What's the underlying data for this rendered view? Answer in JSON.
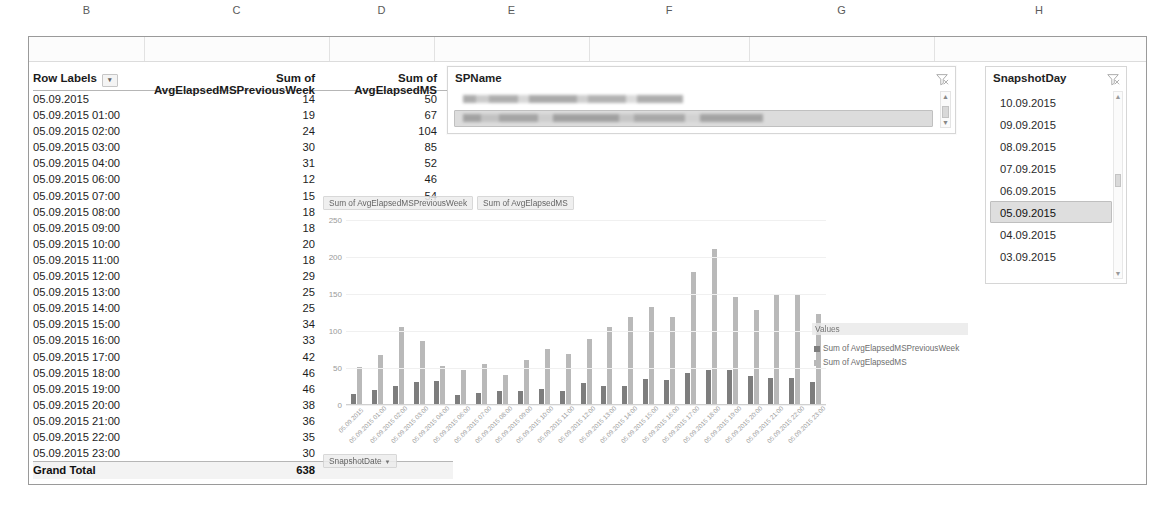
{
  "spreadsheet": {
    "columns": [
      "B",
      "C",
      "D",
      "E",
      "F",
      "G",
      "H"
    ]
  },
  "pivot_table": {
    "headers": {
      "row_labels": "Row Labels",
      "filter_icon": "filter-dropdown-icon",
      "col_prev": "Sum of AvgElapsedMSPreviousWeek",
      "col_curr": "Sum of AvgElapsedMS"
    },
    "rows": [
      {
        "label": "05.09.2015",
        "prev": "14",
        "curr": "50"
      },
      {
        "label": "05.09.2015 01:00",
        "prev": "19",
        "curr": "67"
      },
      {
        "label": "05.09.2015 02:00",
        "prev": "24",
        "curr": "104"
      },
      {
        "label": "05.09.2015 03:00",
        "prev": "30",
        "curr": "85"
      },
      {
        "label": "05.09.2015 04:00",
        "prev": "31",
        "curr": "52"
      },
      {
        "label": "05.09.2015 06:00",
        "prev": "12",
        "curr": "46"
      },
      {
        "label": "05.09.2015 07:00",
        "prev": "15",
        "curr": "54"
      },
      {
        "label": "05.09.2015 08:00",
        "prev": "18",
        "curr": ""
      },
      {
        "label": "05.09.2015 09:00",
        "prev": "18",
        "curr": ""
      },
      {
        "label": "05.09.2015 10:00",
        "prev": "20",
        "curr": ""
      },
      {
        "label": "05.09.2015 11:00",
        "prev": "18",
        "curr": ""
      },
      {
        "label": "05.09.2015 12:00",
        "prev": "29",
        "curr": ""
      },
      {
        "label": "05.09.2015 13:00",
        "prev": "25",
        "curr": ""
      },
      {
        "label": "05.09.2015 14:00",
        "prev": "25",
        "curr": ""
      },
      {
        "label": "05.09.2015 15:00",
        "prev": "34",
        "curr": ""
      },
      {
        "label": "05.09.2015 16:00",
        "prev": "33",
        "curr": ""
      },
      {
        "label": "05.09.2015 17:00",
        "prev": "42",
        "curr": ""
      },
      {
        "label": "05.09.2015 18:00",
        "prev": "46",
        "curr": ""
      },
      {
        "label": "05.09.2015 19:00",
        "prev": "46",
        "curr": ""
      },
      {
        "label": "05.09.2015 20:00",
        "prev": "38",
        "curr": ""
      },
      {
        "label": "05.09.2015 21:00",
        "prev": "36",
        "curr": ""
      },
      {
        "label": "05.09.2015 22:00",
        "prev": "35",
        "curr": ""
      },
      {
        "label": "05.09.2015 23:00",
        "prev": "30",
        "curr": ""
      }
    ],
    "grand_total": {
      "label": "Grand Total",
      "prev": "638",
      "curr": ""
    }
  },
  "slicer_spname": {
    "title": "SPName",
    "clear_filter_icon": "clear-filter-icon",
    "items": [
      {
        "redacted": true,
        "selected": false,
        "width": 220
      },
      {
        "redacted": true,
        "selected": true,
        "width": 300
      }
    ],
    "scroll_up_icon": "scroll-up-arrow-icon",
    "scroll_down_icon": "scroll-down-arrow-icon"
  },
  "slicer_snapshotday": {
    "title": "SnapshotDay",
    "clear_filter_icon": "clear-filter-icon",
    "items": [
      {
        "label": "10.09.2015",
        "selected": false
      },
      {
        "label": "09.09.2015",
        "selected": false
      },
      {
        "label": "08.09.2015",
        "selected": false
      },
      {
        "label": "07.09.2015",
        "selected": false
      },
      {
        "label": "06.09.2015",
        "selected": false
      },
      {
        "label": "05.09.2015",
        "selected": true
      },
      {
        "label": "04.09.2015",
        "selected": false
      },
      {
        "label": "03.09.2015",
        "selected": false
      }
    ],
    "scroll_up_icon": "scroll-up-arrow-icon",
    "scroll_down_icon": "scroll-down-arrow-icon"
  },
  "chart_field_buttons": {
    "value_field_1": "Sum of AvgElapsedMSPreviousWeek",
    "value_field_2": "Sum of AvgElapsedMS",
    "axis_field": "SnapshotDate",
    "axis_dropdown_icon": "chevron-down-icon"
  },
  "legend": {
    "title": "Values",
    "entries": [
      {
        "label": "Sum of AvgElapsedMSPreviousWeek",
        "color": "#7d7d7d"
      },
      {
        "label": "Sum of AvgElapsedMS",
        "color": "#b9b9b9"
      }
    ]
  },
  "chart_data": {
    "type": "bar",
    "title": "",
    "xlabel": "SnapshotDate",
    "ylabel": "",
    "ylim": [
      0,
      250
    ],
    "yticks": [
      "0",
      "50",
      "100",
      "150",
      "200",
      "250"
    ],
    "grid": true,
    "legend_position": "right",
    "categories": [
      "05.09.2015",
      "05.09.2015 01:00",
      "05.09.2015 02:00",
      "05.09.2015 03:00",
      "05.09.2015 04:00",
      "05.09.2015 06:00",
      "05.09.2015 07:00",
      "05.09.2015 08:00",
      "05.09.2015 09:00",
      "05.09.2015 10:00",
      "05.09.2015 11:00",
      "05.09.2015 12:00",
      "05.09.2015 13:00",
      "05.09.2015 14:00",
      "05.09.2015 15:00",
      "05.09.2015 16:00",
      "05.09.2015 17:00",
      "05.09.2015 18:00",
      "05.09.2015 19:00",
      "05.09.2015 20:00",
      "05.09.2015 21:00",
      "05.09.2015 22:00",
      "05.09.2015 23:00"
    ],
    "series": [
      {
        "name": "Sum of AvgElapsedMSPreviousWeek",
        "color": "#7d7d7d",
        "values": [
          14,
          19,
          24,
          30,
          31,
          12,
          15,
          18,
          18,
          20,
          18,
          29,
          25,
          25,
          34,
          33,
          42,
          46,
          46,
          38,
          36,
          35,
          30
        ]
      },
      {
        "name": "Sum of AvgElapsedMS",
        "color": "#b9b9b9",
        "values": [
          50,
          67,
          104,
          85,
          52,
          46,
          54,
          40,
          60,
          75,
          68,
          88,
          104,
          118,
          132,
          118,
          180,
          210,
          145,
          128,
          150,
          148,
          122
        ]
      }
    ]
  }
}
